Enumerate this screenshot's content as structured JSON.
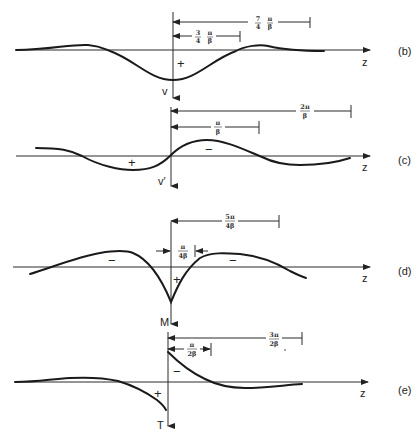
{
  "figure": {
    "panels": [
      {
        "id": "b",
        "panel_label": "(b)",
        "axis_label": "z",
        "vertical_label": "v",
        "signs": [
          "+"
        ],
        "dimensions": [
          {
            "num": "7",
            "den": "4",
            "factor": "π/β",
            "text": "7/4 π/β"
          },
          {
            "num": "3",
            "den": "4",
            "factor": "π/β",
            "text": "3/4 π/β"
          }
        ]
      },
      {
        "id": "c",
        "panel_label": "(c)",
        "axis_label": "z",
        "vertical_label": "v′",
        "signs": [
          "+",
          "−"
        ],
        "dimensions": [
          {
            "num": "2π",
            "den": "β",
            "text": "2π/β"
          },
          {
            "num": "π",
            "den": "β",
            "text": "π/β"
          }
        ]
      },
      {
        "id": "d",
        "panel_label": "(d)",
        "axis_label": "z",
        "vertical_label": "M",
        "signs": [
          "−",
          "+",
          "−"
        ],
        "dimensions": [
          {
            "num": "5π",
            "den": "4β",
            "text": "5π/4β"
          },
          {
            "num": "π",
            "den": "4β",
            "text": "π/4β"
          }
        ]
      },
      {
        "id": "e",
        "panel_label": "(e)",
        "axis_label": "z",
        "vertical_label": "T",
        "signs": [
          "−",
          "+"
        ],
        "dimensions": [
          {
            "num": "3π",
            "den": "2β",
            "text": "3π/2β"
          },
          {
            "num": "π",
            "den": "2β",
            "text": "π/2β"
          }
        ]
      }
    ],
    "colors": {
      "ink": "#1a1a1a",
      "background": "#ffffff"
    }
  }
}
